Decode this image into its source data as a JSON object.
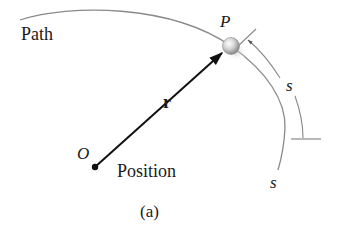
{
  "figure": {
    "caption": "(a)",
    "subtitle": "Position",
    "path_label": "Path",
    "particle_label": "P",
    "origin_label": "O",
    "vector_label": "r",
    "arc_label_outer": "s",
    "arc_label_path_end": "s"
  },
  "colors": {
    "path_stroke": "#8a8a8a",
    "vector_stroke": "#111111",
    "text": "#1a1a1a",
    "particle_light": "#f2f2f2",
    "particle_dark": "#8c8c8c"
  },
  "geometry": {
    "origin": [
      95,
      167
    ],
    "particle": [
      231,
      46
    ],
    "particle_radius": 9
  }
}
